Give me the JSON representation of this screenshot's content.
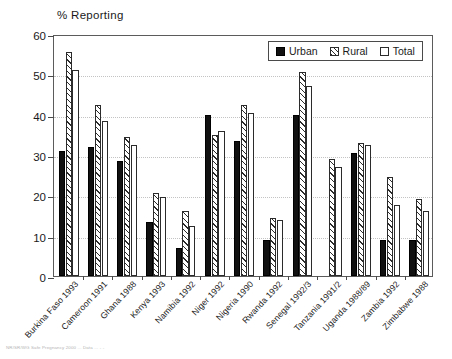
{
  "figure": {
    "y_axis_title": "% Reporting",
    "footnote": "NR/SR/WG Safe Pregnancy 2000 ...   Data ...   -  -"
  },
  "legend": {
    "position": "top-right-inside",
    "items": [
      {
        "label": "Urban",
        "swatch": "solid-black-swatch-icon",
        "color": "#111111"
      },
      {
        "label": "Rural",
        "swatch": "hatched-swatch-icon",
        "color": "#2b2b2b"
      },
      {
        "label": "Total",
        "swatch": "empty-swatch-icon",
        "color": "#ffffff"
      }
    ]
  },
  "chart_data": {
    "type": "bar",
    "title": "",
    "subtitle": "",
    "xlabel": "",
    "ylabel": "% Reporting",
    "ylim": [
      0,
      60
    ],
    "yticks": [
      0,
      10,
      20,
      30,
      40,
      50,
      60
    ],
    "grid": true,
    "grid_axis": "y",
    "categories": [
      "Burkina Faso 1993",
      "Cameroon 1991",
      "Ghana 1988",
      "Kenya 1993",
      "Namibia 1992",
      "Niger 1992",
      "Nigeria 1990",
      "Rwanda 1992",
      "Senegal 1992/3",
      "Tanzania 1991/2",
      "Uganda 1988/89",
      "Zambia 1992",
      "Zimbabwe 1988"
    ],
    "series": [
      {
        "name": "Urban",
        "values": [
          31,
          32,
          28.5,
          13.5,
          7,
          40,
          33.5,
          9,
          40,
          null,
          30.5,
          9,
          9
        ]
      },
      {
        "name": "Rural",
        "values": [
          55.5,
          42.5,
          34.5,
          20.5,
          16,
          35,
          42.5,
          14.5,
          50.5,
          29,
          33,
          24.5,
          19
        ]
      },
      {
        "name": "Total",
        "values": [
          51,
          38.5,
          32.5,
          19.5,
          12.5,
          36,
          40.5,
          14,
          47,
          27,
          32.5,
          17.5,
          16
        ]
      }
    ]
  }
}
